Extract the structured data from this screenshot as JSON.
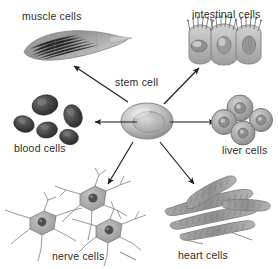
{
  "diagram": {
    "center": {
      "label": "stem cell",
      "label_x": 115,
      "label_y": 76
    },
    "background_color": "#ffffff",
    "text_color": "#2b2b2b",
    "arrow_color": "#1a1a1a",
    "cell_fill_light": "#c9c9c9",
    "cell_fill_mid": "#9a9a9a",
    "cell_fill_dark": "#4a4a4a",
    "cell_outline": "#6e6e6e",
    "targets": [
      {
        "id": "muscle-cells",
        "label": "muscle cells",
        "label_x": 22,
        "label_y": 10,
        "direction": "up-left"
      },
      {
        "id": "intestinal-cells",
        "label": "intestinal cells",
        "label_x": 192,
        "label_y": 8,
        "direction": "up-right"
      },
      {
        "id": "blood-cells",
        "label": "blood cells",
        "label_x": 14,
        "label_y": 142,
        "direction": "left"
      },
      {
        "id": "liver-cells",
        "label": "liver cells",
        "label_x": 222,
        "label_y": 144,
        "direction": "right"
      },
      {
        "id": "nerve-cells",
        "label": "nerve cells",
        "label_x": 52,
        "label_y": 250,
        "direction": "down-left"
      },
      {
        "id": "heart-cells",
        "label": "heart cells",
        "label_x": 178,
        "label_y": 249,
        "direction": "down-right"
      }
    ],
    "arrows": [
      {
        "id": "arrow-to-muscle",
        "from": [
          128,
          100
        ],
        "to": [
          72,
          64
        ],
        "target": "muscle-cells"
      },
      {
        "id": "arrow-to-intestinal",
        "from": [
          160,
          100
        ],
        "to": [
          198,
          66
        ],
        "target": "intestinal-cells"
      },
      {
        "id": "arrow-to-blood",
        "from": [
          137,
          122
        ],
        "to": [
          93,
          122
        ],
        "target": "blood-cells"
      },
      {
        "id": "arrow-to-liver",
        "from": [
          168,
          122
        ],
        "to": [
          216,
          122
        ],
        "target": "liver-cells"
      },
      {
        "id": "arrow-to-nerve",
        "from": [
          131,
          142
        ],
        "to": [
          106,
          186
        ],
        "target": "nerve-cells"
      },
      {
        "id": "arrow-to-heart",
        "from": [
          158,
          142
        ],
        "to": [
          193,
          185
        ],
        "target": "heart-cells"
      }
    ]
  }
}
